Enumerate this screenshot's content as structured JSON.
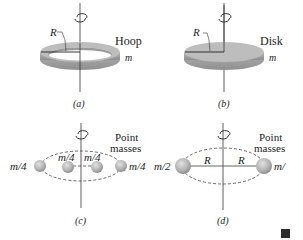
{
  "panels": {
    "a": {
      "caption": "(a)",
      "name_label": "Hoop",
      "mass_label": "m",
      "radius_label": "R"
    },
    "b": {
      "caption": "(b)",
      "name_label": "Disk",
      "mass_label": "m",
      "radius_label": "R"
    },
    "c": {
      "caption": "(c)",
      "name_label_line1": "Point",
      "name_label_line2": "masses",
      "mass_labels": [
        "m/4",
        "m/4",
        "m/4",
        "m/4"
      ]
    },
    "d": {
      "caption": "(d)",
      "name_label_line1": "Point",
      "name_label_line2": "masses",
      "mass_labels": [
        "m/2",
        "m/"
      ],
      "radius_labels": [
        "R",
        "R"
      ]
    }
  },
  "colors": {
    "solid_gray": "#a9a9a9",
    "solid_top": "#bdbdbd",
    "sphere": "#b8b8b8",
    "line": "#333333",
    "end_mark": "#2b2b2b"
  }
}
